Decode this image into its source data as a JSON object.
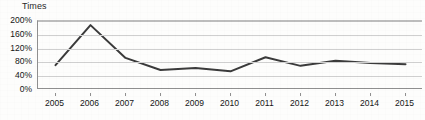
{
  "chart_data": {
    "type": "line",
    "title": "",
    "ylabel": "Times",
    "xlabel": "",
    "categories": [
      "2005",
      "2006",
      "2007",
      "2008",
      "2009",
      "2010",
      "2011",
      "2012",
      "2013",
      "2014",
      "2015"
    ],
    "values": [
      72,
      188,
      93,
      58,
      64,
      54,
      95,
      70,
      85,
      78,
      75
    ],
    "series": [
      {
        "name": "Times",
        "values": [
          72,
          188,
          93,
          58,
          64,
          54,
          95,
          70,
          85,
          78,
          75
        ]
      }
    ],
    "ylim": [
      0,
      200
    ],
    "ytick_values": [
      0,
      40,
      80,
      120,
      160,
      200
    ],
    "ytick_labels": [
      "0%",
      "40%",
      "80%",
      "120%",
      "160%",
      "200%"
    ],
    "grid": true,
    "legend": "none",
    "line_color": "#3b3b3b",
    "gridline_color": "#cfcfcf",
    "axis_color": "#8f8f8f",
    "background_color": "#fdfdfc"
  }
}
